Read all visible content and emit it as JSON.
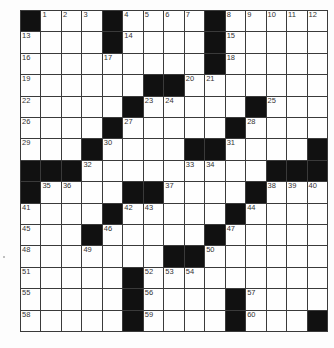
{
  "puzzle": {
    "size": {
      "rows": 15,
      "cols": 15
    },
    "layout": [
      "#...#....#.....",
      "....#....#.....",
      ".........#.....",
      "......##.......",
      ".....#.....#...",
      "....#.....#....",
      "...#....##....#",
      "###.........###",
      "#....##....#...",
      "....#.....#....",
      "...#.....#.....",
      ".......##......",
      ".....#.........",
      ".....#....#....",
      ".....#....#...#"
    ],
    "numbers": [
      {
        "r": 0,
        "c": 1,
        "n": "1"
      },
      {
        "r": 0,
        "c": 2,
        "n": "2"
      },
      {
        "r": 0,
        "c": 3,
        "n": "3"
      },
      {
        "r": 0,
        "c": 5,
        "n": "4"
      },
      {
        "r": 0,
        "c": 6,
        "n": "5"
      },
      {
        "r": 0,
        "c": 7,
        "n": "6"
      },
      {
        "r": 0,
        "c": 8,
        "n": "7"
      },
      {
        "r": 0,
        "c": 10,
        "n": "8"
      },
      {
        "r": 0,
        "c": 11,
        "n": "9"
      },
      {
        "r": 0,
        "c": 12,
        "n": "10"
      },
      {
        "r": 0,
        "c": 13,
        "n": "11"
      },
      {
        "r": 0,
        "c": 14,
        "n": "12"
      },
      {
        "r": 1,
        "c": 0,
        "n": "13"
      },
      {
        "r": 1,
        "c": 5,
        "n": "14"
      },
      {
        "r": 1,
        "c": 10,
        "n": "15"
      },
      {
        "r": 2,
        "c": 0,
        "n": "16"
      },
      {
        "r": 2,
        "c": 4,
        "n": "17"
      },
      {
        "r": 2,
        "c": 10,
        "n": "18"
      },
      {
        "r": 3,
        "c": 0,
        "n": "19"
      },
      {
        "r": 3,
        "c": 8,
        "n": "20"
      },
      {
        "r": 3,
        "c": 9,
        "n": "21"
      },
      {
        "r": 4,
        "c": 0,
        "n": "22"
      },
      {
        "r": 4,
        "c": 6,
        "n": "23"
      },
      {
        "r": 4,
        "c": 7,
        "n": "24"
      },
      {
        "r": 4,
        "c": 12,
        "n": "25"
      },
      {
        "r": 5,
        "c": 0,
        "n": "26"
      },
      {
        "r": 5,
        "c": 5,
        "n": "27"
      },
      {
        "r": 5,
        "c": 11,
        "n": "28"
      },
      {
        "r": 6,
        "c": 0,
        "n": "29"
      },
      {
        "r": 6,
        "c": 4,
        "n": "30"
      },
      {
        "r": 6,
        "c": 10,
        "n": "31"
      },
      {
        "r": 7,
        "c": 3,
        "n": "32"
      },
      {
        "r": 7,
        "c": 8,
        "n": "33"
      },
      {
        "r": 7,
        "c": 9,
        "n": "34"
      },
      {
        "r": 8,
        "c": 1,
        "n": "35"
      },
      {
        "r": 8,
        "c": 2,
        "n": "36"
      },
      {
        "r": 8,
        "c": 7,
        "n": "37"
      },
      {
        "r": 8,
        "c": 12,
        "n": "38"
      },
      {
        "r": 8,
        "c": 13,
        "n": "39"
      },
      {
        "r": 8,
        "c": 14,
        "n": "40"
      },
      {
        "r": 9,
        "c": 0,
        "n": "41"
      },
      {
        "r": 9,
        "c": 5,
        "n": "42"
      },
      {
        "r": 9,
        "c": 6,
        "n": "43"
      },
      {
        "r": 9,
        "c": 11,
        "n": "44"
      },
      {
        "r": 10,
        "c": 0,
        "n": "45"
      },
      {
        "r": 10,
        "c": 4,
        "n": "46"
      },
      {
        "r": 10,
        "c": 10,
        "n": "47"
      },
      {
        "r": 11,
        "c": 0,
        "n": "48"
      },
      {
        "r": 11,
        "c": 3,
        "n": "49"
      },
      {
        "r": 11,
        "c": 9,
        "n": "50"
      },
      {
        "r": 12,
        "c": 0,
        "n": "51"
      },
      {
        "r": 12,
        "c": 6,
        "n": "52"
      },
      {
        "r": 12,
        "c": 7,
        "n": "53"
      },
      {
        "r": 12,
        "c": 8,
        "n": "54"
      },
      {
        "r": 13,
        "c": 0,
        "n": "55"
      },
      {
        "r": 13,
        "c": 6,
        "n": "56"
      },
      {
        "r": 13,
        "c": 11,
        "n": "57"
      },
      {
        "r": 14,
        "c": 0,
        "n": "58"
      },
      {
        "r": 14,
        "c": 6,
        "n": "59"
      },
      {
        "r": 14,
        "c": 11,
        "n": "60"
      }
    ],
    "colors": {
      "block": "#111111",
      "line": "#3a3a3a",
      "cell": "#fefefe"
    }
  }
}
